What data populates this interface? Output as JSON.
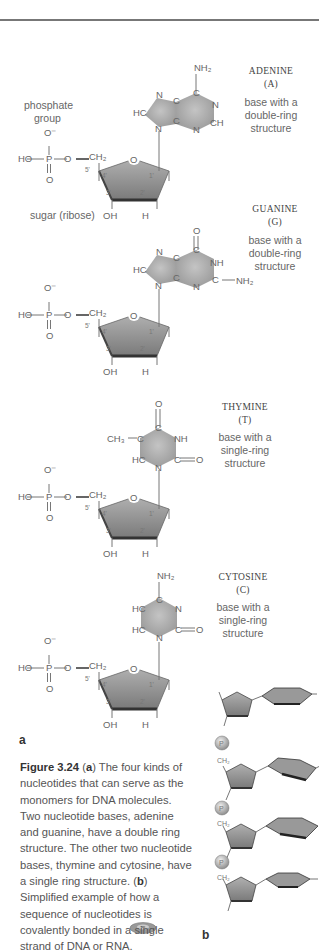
{
  "figure": {
    "panel_a_label": "a",
    "panel_b_label": "b",
    "annotations": {
      "phosphate_group_line1": "phosphate",
      "phosphate_group_line2": "group",
      "sugar_label": "sugar (ribose)"
    },
    "nucleotides": [
      {
        "name": "ADENINE",
        "abbr": "(A)",
        "desc1": "base with a",
        "desc2": "double-ring",
        "desc3": "structure"
      },
      {
        "name": "GUANINE",
        "abbr": "(G)",
        "desc1": "base with a",
        "desc2": "double-ring",
        "desc3": "structure"
      },
      {
        "name": "THYMINE",
        "abbr": "(T)",
        "desc1": "base with a",
        "desc2": "single-ring",
        "desc3": "structure"
      },
      {
        "name": "CYTOSINE",
        "abbr": "(C)",
        "desc1": "base with a",
        "desc2": "single-ring",
        "desc3": "structure"
      }
    ],
    "atoms": {
      "O_minus": "O⁻",
      "HO": "HO",
      "P": "P",
      "O": "O",
      "CH2": "CH₂",
      "OH": "OH",
      "H": "H",
      "NH2": "NH₂",
      "NH": "NH",
      "N": "N",
      "C": "C",
      "HC": "HC",
      "CH": "CH",
      "CH3": "CH₃",
      "c5": "5'",
      "c4": "4'",
      "c3": "3'",
      "c2": "2'",
      "c1": "1'"
    },
    "caption": {
      "figure_number": "Figure 3.24",
      "part_a_marker": "a",
      "part_a_text": " The four kinds of nucleotides that can serve as the monomers for DNA molecules. Two nucleotide bases, adenine and guanine, have a double ring structure. The other two nucleotide bases, thymine and cytosine, have a single ring structure. ",
      "part_b_marker": "b",
      "part_b_text": " Simplified example of how a sequence of nucleotides is covalently bonded in a single strand of DNA or RNA."
    },
    "colors": {
      "ring_fill": "#a8a8a8",
      "sugar_fill": "#8c8c8c",
      "sugar_edge": "#3a3a3a",
      "text": "#666666",
      "rule": "#777777"
    }
  }
}
